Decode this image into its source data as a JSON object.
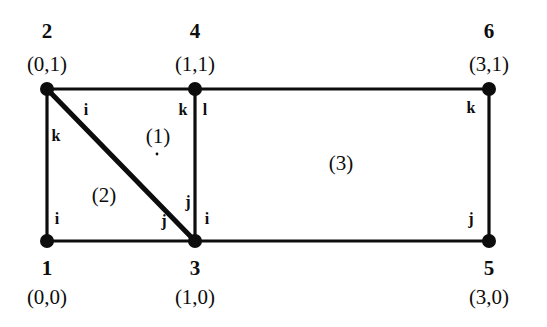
{
  "figure": {
    "kind": "finite-element-mesh",
    "width": 547,
    "height": 327,
    "background": "#ffffff",
    "ink_color": "#0d0d0d"
  },
  "nodes": [
    {
      "id": "n1",
      "number": "1",
      "coord": "(0,0)",
      "x": 47,
      "y": 241,
      "num_x": 47,
      "num_y": 268,
      "coord_x": 47,
      "coord_y": 297
    },
    {
      "id": "n2",
      "number": "2",
      "coord": "(0,1)",
      "x": 47,
      "y": 89,
      "num_x": 47,
      "num_y": 31,
      "coord_x": 47,
      "coord_y": 64
    },
    {
      "id": "n3",
      "number": "3",
      "coord": "(1,0)",
      "x": 195,
      "y": 241,
      "num_x": 195,
      "num_y": 268,
      "coord_x": 195,
      "coord_y": 297
    },
    {
      "id": "n4",
      "number": "4",
      "coord": "(1,1)",
      "x": 195,
      "y": 89,
      "num_x": 195,
      "num_y": 31,
      "coord_x": 195,
      "coord_y": 64
    },
    {
      "id": "n5",
      "number": "5",
      "coord": "(3,0)",
      "x": 489,
      "y": 241,
      "num_x": 489,
      "num_y": 268,
      "coord_x": 489,
      "coord_y": 297
    },
    {
      "id": "n6",
      "number": "6",
      "coord": "(3,1)",
      "x": 489,
      "y": 89,
      "num_x": 489,
      "num_y": 31,
      "coord_x": 489,
      "coord_y": 64
    }
  ],
  "edges": [
    {
      "id": "e-top-2-4",
      "x1": 47,
      "y1": 89,
      "x2": 195,
      "y2": 89,
      "width": 3.2
    },
    {
      "id": "e-top-4-6",
      "x1": 195,
      "y1": 89,
      "x2": 489,
      "y2": 89,
      "width": 3.2
    },
    {
      "id": "e-left-1-2",
      "x1": 47,
      "y1": 89,
      "x2": 47,
      "y2": 241,
      "width": 3.2
    },
    {
      "id": "e-mid-3-4",
      "x1": 195,
      "y1": 89,
      "x2": 195,
      "y2": 241,
      "width": 3.2
    },
    {
      "id": "e-right-5-6",
      "x1": 489,
      "y1": 89,
      "x2": 489,
      "y2": 241,
      "width": 3.2
    },
    {
      "id": "e-bot-1-3",
      "x1": 47,
      "y1": 241,
      "x2": 195,
      "y2": 241,
      "width": 3.2
    },
    {
      "id": "e-bot-3-5",
      "x1": 195,
      "y1": 241,
      "x2": 489,
      "y2": 241,
      "width": 3.2
    },
    {
      "id": "e-diag-2-3",
      "x1": 47,
      "y1": 89,
      "x2": 195,
      "y2": 241,
      "width": 5.0
    }
  ],
  "node_dots": [
    {
      "id": "d1",
      "x": 47,
      "y": 241,
      "r": 7
    },
    {
      "id": "d2",
      "x": 47,
      "y": 89,
      "r": 7
    },
    {
      "id": "d3",
      "x": 195,
      "y": 241,
      "r": 7
    },
    {
      "id": "d4",
      "x": 195,
      "y": 89,
      "r": 7
    },
    {
      "id": "d5",
      "x": 489,
      "y": 241,
      "r": 7
    },
    {
      "id": "d6",
      "x": 489,
      "y": 89,
      "r": 7
    }
  ],
  "elements": [
    {
      "id": "el1",
      "label": "(1)",
      "x": 158,
      "y": 136
    },
    {
      "id": "el2",
      "label": "(2)",
      "x": 104,
      "y": 195
    },
    {
      "id": "el3",
      "label": "(3)",
      "x": 341,
      "y": 163
    }
  ],
  "corner_labels": [
    {
      "id": "c1",
      "text": "i",
      "x": 86,
      "y": 110,
      "element": "1",
      "at_node": "2"
    },
    {
      "id": "c2",
      "text": "k",
      "x": 56,
      "y": 136,
      "element": "2",
      "at_node": "2"
    },
    {
      "id": "c3",
      "text": "k",
      "x": 183,
      "y": 110,
      "element": "1",
      "at_node": "4"
    },
    {
      "id": "c4",
      "text": "l",
      "x": 205,
      "y": 110,
      "element": "3",
      "at_node": "4"
    },
    {
      "id": "c5",
      "text": "k",
      "x": 471,
      "y": 108,
      "element": "3",
      "at_node": "6"
    },
    {
      "id": "c6",
      "text": "i",
      "x": 57,
      "y": 219,
      "element": "2",
      "at_node": "1"
    },
    {
      "id": "c7",
      "text": "j",
      "x": 164,
      "y": 221,
      "element": "2",
      "at_node": "3"
    },
    {
      "id": "c8",
      "text": "j",
      "x": 188,
      "y": 202,
      "element": "1",
      "at_node": "3"
    },
    {
      "id": "c9",
      "text": "i",
      "x": 207,
      "y": 219,
      "element": "3",
      "at_node": "3"
    },
    {
      "id": "c10",
      "text": "j",
      "x": 471,
      "y": 219,
      "element": "3",
      "at_node": "5"
    }
  ],
  "speck": {
    "x": 157,
    "y": 154,
    "r": 1.4
  }
}
